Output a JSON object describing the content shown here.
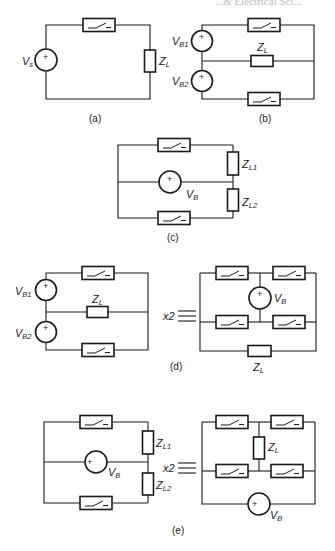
{
  "header": {
    "partial_text": "...& Electrical Sci..."
  },
  "diagram": {
    "type": "circuit-diagrams",
    "panels": [
      {
        "id": "a",
        "caption": "(a)",
        "sources": [
          "Vs"
        ],
        "loads": [
          "ZL"
        ],
        "switches": 1
      },
      {
        "id": "b",
        "caption": "(b)",
        "sources": [
          "VB1",
          "VB2"
        ],
        "loads": [
          "ZL"
        ],
        "switches": 2
      },
      {
        "id": "c",
        "caption": "(c)",
        "sources": [
          "VB"
        ],
        "loads": [
          "ZL1",
          "ZL2"
        ],
        "switches": 2
      },
      {
        "id": "d",
        "caption": "(d)",
        "sources": [
          "VB1",
          "VB2"
        ],
        "loads": [
          "ZL"
        ],
        "switches": 2,
        "equivalent": {
          "multiplier": "x2",
          "symbol": "≡",
          "sources": [
            "VB"
          ],
          "loads": [
            "ZL"
          ],
          "switches": 4
        }
      },
      {
        "id": "e",
        "caption": "(e)",
        "sources": [
          "VB"
        ],
        "loads": [
          "ZL1",
          "ZL2"
        ],
        "switches": 2,
        "equivalent": {
          "multiplier": "x2",
          "symbol": "≡",
          "sources": [
            "VB"
          ],
          "loads": [
            "ZL"
          ],
          "switches": 4
        }
      }
    ]
  },
  "labels": {
    "a": {
      "source": "V",
      "source_sub": "s",
      "load": "Z",
      "load_sub": "L",
      "caption": "(a)"
    },
    "b": {
      "src1": "V",
      "src1_sub": "B1",
      "src2": "V",
      "src2_sub": "B2",
      "load": "Z",
      "load_sub": "L",
      "caption": "(b)"
    },
    "c": {
      "source": "V",
      "source_sub": "B",
      "load1": "Z",
      "load1_sub": "L1",
      "load2": "Z",
      "load2_sub": "L2",
      "caption": "(c)"
    },
    "d": {
      "src1": "V",
      "src1_sub": "B1",
      "src2": "V",
      "src2_sub": "B2",
      "load": "Z",
      "load_sub": "L",
      "mult": "x2",
      "eq_source": "V",
      "eq_source_sub": "B",
      "eq_load": "Z",
      "eq_load_sub": "L",
      "caption": "(d)"
    },
    "e": {
      "load1": "Z",
      "load1_sub": "L1",
      "source": "V",
      "source_sub": "B",
      "load2": "Z",
      "load2_sub": "L2",
      "mult": "x2",
      "eq_load": "Z",
      "eq_load_sub": "L",
      "eq_source": "V",
      "eq_source_sub": "B",
      "caption": "(e)"
    }
  },
  "symbols": {
    "plus": "+"
  }
}
